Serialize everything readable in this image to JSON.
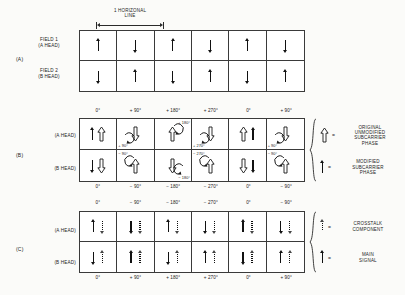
{
  "figure": {
    "header_label": "1 HORIZONAL\nLINE",
    "section_labels": {
      "a": "(A)",
      "b": "(B)",
      "c": "(C)"
    },
    "row_labels": {
      "a_top": "FIELD 1\n(A HEAD)",
      "a_bottom": "FIELD 2\n(B HEAD)",
      "b_top": "(A HEAD)",
      "b_bottom": "(B HEAD)",
      "c_top": "(A HEAD)",
      "c_bottom": "(B HEAD)"
    }
  },
  "section_a": {
    "columns": 6,
    "top_row": [
      "up",
      "down",
      "up",
      "down",
      "up",
      "down"
    ],
    "bottom_row": [
      "down",
      "up",
      "down",
      "up",
      "down",
      "up"
    ]
  },
  "section_b": {
    "columns": 6,
    "top_degrees": [
      "0°",
      "+ 90°",
      "+ 180°",
      "+ 270°",
      "0°",
      "+ 90°"
    ],
    "bottom_degrees": [
      "0°",
      "− 90°",
      "− 180°",
      "− 270°",
      "0°",
      "− 90°"
    ],
    "top_row": [
      {
        "thin": "up",
        "hollow": "up",
        "thin_first": true,
        "rotation": "",
        "rot_pos": ""
      },
      {
        "thin": "",
        "hollow": "down",
        "thin_first": false,
        "rotation": "+ 90°",
        "rot_pos": "bl"
      },
      {
        "thin": "",
        "hollow": "up",
        "thin_first": false,
        "rotation": "+ 180°",
        "rot_pos": "tr"
      },
      {
        "thin": "",
        "hollow": "down",
        "thin_first": false,
        "rotation": "+ 270°",
        "rot_pos": "bl"
      },
      {
        "thin": "up",
        "hollow": "up",
        "thin_first": false,
        "rotation": "",
        "rot_pos": ""
      },
      {
        "thin": "",
        "hollow": "down",
        "thin_first": false,
        "rotation": "+ 90°",
        "rot_pos": "bl"
      }
    ],
    "bottom_row": [
      {
        "thin": "down",
        "hollow": "down",
        "thin_first": true,
        "rotation": "",
        "rot_pos": ""
      },
      {
        "thin": "",
        "hollow": "up",
        "thin_first": false,
        "rotation": "− 90°",
        "rot_pos": "tl"
      },
      {
        "thin": "",
        "hollow": "down",
        "thin_first": false,
        "rotation": "− 180°",
        "rot_pos": "br"
      },
      {
        "thin": "",
        "hollow": "up",
        "thin_first": false,
        "rotation": "− 270°",
        "rot_pos": "tl"
      },
      {
        "thin": "down",
        "hollow": "down",
        "thin_first": false,
        "rotation": "",
        "rot_pos": ""
      },
      {
        "thin": "",
        "hollow": "up",
        "thin_first": false,
        "rotation": "− 90°",
        "rot_pos": "tl"
      }
    ],
    "legend": [
      {
        "symbol": "hollow-up",
        "eq": "=",
        "text": "ORIGINAL\nUNMODIFIED\nSUBCARRIER\nPHASE"
      },
      {
        "symbol": "thin-up",
        "eq": "=",
        "text": "MODIFIED\nSUBCARRIER\nPHASE"
      }
    ]
  },
  "section_c": {
    "columns": 6,
    "top_degrees": [
      "0°",
      "− 90°",
      "− 180°",
      "− 270°",
      "0°",
      "− 90°"
    ],
    "bottom_degrees": [
      "0°",
      "+ 90°",
      "+ 180°",
      "+ 270°",
      "0°",
      "+ 90°"
    ],
    "top_row": [
      {
        "main": "up",
        "cross": "down"
      },
      {
        "main": "down",
        "cross": "down"
      },
      {
        "main": "up",
        "cross": "down"
      },
      {
        "main": "down",
        "cross": "down"
      },
      {
        "main": "up",
        "cross": "down"
      },
      {
        "main": "down",
        "cross": "down"
      }
    ],
    "bottom_row": [
      {
        "main": "down",
        "cross": "up"
      },
      {
        "main": "up",
        "cross": "up"
      },
      {
        "main": "down",
        "cross": "up"
      },
      {
        "main": "up",
        "cross": "up"
      },
      {
        "main": "down",
        "cross": "up"
      },
      {
        "main": "up",
        "cross": "up"
      }
    ],
    "legend": [
      {
        "symbol": "dot-up",
        "eq": "=",
        "text": "CROSSTALK\nCOMPONENT"
      },
      {
        "symbol": "thin-up",
        "eq": "=",
        "text": "MAIN\nSIGNAL"
      }
    ]
  },
  "colors": {
    "ink": "#1a1a1a",
    "rule": "#3a3a3a",
    "paper": "#fbfbf9",
    "cell": "#ffffff"
  }
}
